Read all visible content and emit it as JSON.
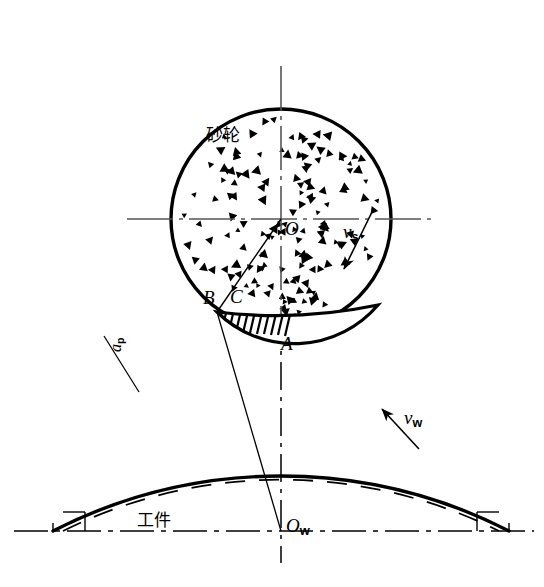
{
  "figure": {
    "background_color": "#ffffff",
    "line_color": "#000000",
    "width": 544,
    "height": 587
  },
  "labels": {
    "wheel_name": "砂轮",
    "workpiece_name": "工件",
    "wheel_center": "O",
    "workpiece_center": "O",
    "workpiece_center_sub": "w",
    "point_a": "A",
    "point_b": "B",
    "point_c": "C",
    "wheel_speed": "v",
    "wheel_speed_sub": "s",
    "work_speed": "v",
    "work_speed_sub": "w",
    "depth_of_cut": "a",
    "depth_of_cut_sub": "p"
  },
  "geometry": {
    "wheel": {
      "cx": 281,
      "cy": 219,
      "r": 110,
      "stroke_width": 3.4
    },
    "workpiece": {
      "center_x": 281,
      "center_y": 810,
      "outer_radius": 500,
      "inner_radius": 489,
      "baseline_y": 531,
      "left_end_x": 53,
      "right_end_x": 509,
      "stroke_width": 3.4,
      "dashed_stroke_width": 1.8
    },
    "contact": {
      "point_a": {
        "x": 281,
        "y": 322
      },
      "point_b": {
        "x": 217,
        "y": 312
      },
      "point_c": {
        "x": 236,
        "y": 306
      },
      "hatch_count": 11
    },
    "axes": {
      "wheel_horizontal": {
        "x1": 127,
        "x2": 437,
        "y": 219
      },
      "wheel_vertical": {
        "x": 281,
        "y1": 66,
        "y2": 330
      },
      "workpiece_vertical": {
        "x": 281,
        "y1": 322,
        "y2": 563
      },
      "workpiece_horizontal": {
        "x1": 14,
        "x2": 534,
        "y": 531
      }
    },
    "vector_wheel_speed": {
      "x1": 372,
      "y1": 214,
      "x2": 345,
      "y2": 268
    },
    "vector_work_speed": {
      "x1": 417,
      "y1": 447,
      "x2": 383,
      "y2": 410
    },
    "radius_line_ob": {
      "x1": 281,
      "y1": 219,
      "x2": 217,
      "y2": 312
    },
    "line_b_to_ow": {
      "x1": 217,
      "y1": 312,
      "x2": 281,
      "y2": 531
    },
    "depth_leader": {
      "x1": 104,
      "y1": 336,
      "x2": 139,
      "y2": 392
    },
    "grain_count": 150
  }
}
